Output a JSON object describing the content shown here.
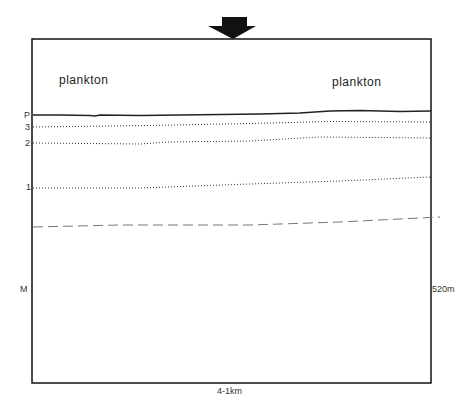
{
  "figure": {
    "zone_labels": {
      "left": "plankton",
      "right": "plankton"
    },
    "layer_labels": {
      "P": "P",
      "three": "3",
      "two": "2",
      "one": "1",
      "M": "M"
    },
    "depth_label": "520m",
    "distance_label": "4-1km",
    "marker_icon": "down-arrow-icon",
    "colors": {
      "frame": "#111111",
      "line": "#222222",
      "dashed": "#777777"
    }
  }
}
